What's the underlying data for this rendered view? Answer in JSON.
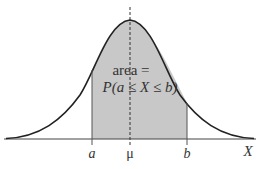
{
  "diagram": {
    "area_label_line1": "area =",
    "area_label_line2": "P(a ≤ X ≤ b)",
    "axis_labels": {
      "a": "a",
      "mu": "μ",
      "b": "b",
      "x": "X"
    },
    "colors": {
      "shade": "#c8c8c8",
      "curve": "#222222",
      "axis": "#444444"
    }
  }
}
